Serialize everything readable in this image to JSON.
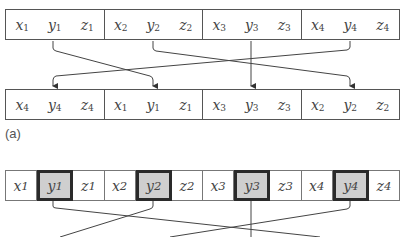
{
  "panel_a": {
    "label": "(a)",
    "top_row": [
      [
        {
          "v": "x",
          "s": "1"
        },
        {
          "v": "y",
          "s": "1"
        },
        {
          "v": "z",
          "s": "1"
        }
      ],
      [
        {
          "v": "x",
          "s": "2"
        },
        {
          "v": "y",
          "s": "2"
        },
        {
          "v": "z",
          "s": "2"
        }
      ],
      [
        {
          "v": "x",
          "s": "3"
        },
        {
          "v": "y",
          "s": "3"
        },
        {
          "v": "z",
          "s": "3"
        }
      ],
      [
        {
          "v": "x",
          "s": "4"
        },
        {
          "v": "y",
          "s": "4"
        },
        {
          "v": "z",
          "s": "4"
        }
      ]
    ],
    "bottom_row": [
      [
        {
          "v": "x",
          "s": "4"
        },
        {
          "v": "y",
          "s": "4"
        },
        {
          "v": "z",
          "s": "4"
        }
      ],
      [
        {
          "v": "x",
          "s": "1"
        },
        {
          "v": "y",
          "s": "1"
        },
        {
          "v": "z",
          "s": "1"
        }
      ],
      [
        {
          "v": "x",
          "s": "3"
        },
        {
          "v": "y",
          "s": "3"
        },
        {
          "v": "z",
          "s": "3"
        }
      ],
      [
        {
          "v": "x",
          "s": "2"
        },
        {
          "v": "y",
          "s": "2"
        },
        {
          "v": "z",
          "s": "2"
        }
      ]
    ],
    "mapping": [
      {
        "from": "group 1 (y1)",
        "to": "position 2"
      },
      {
        "from": "group 2 (y2)",
        "to": "position 4"
      },
      {
        "from": "group 3 (y3)",
        "to": "position 3"
      },
      {
        "from": "group 4 (y4)",
        "to": "position 1"
      }
    ]
  },
  "panel_b": {
    "cells": [
      {
        "v": "x",
        "s": "1",
        "highlight": false
      },
      {
        "v": "y",
        "s": "1",
        "highlight": true
      },
      {
        "v": "z",
        "s": "1",
        "highlight": false
      },
      {
        "v": "x",
        "s": "2",
        "highlight": false
      },
      {
        "v": "y",
        "s": "2",
        "highlight": true
      },
      {
        "v": "z",
        "s": "2",
        "highlight": false
      },
      {
        "v": "x",
        "s": "3",
        "highlight": false
      },
      {
        "v": "y",
        "s": "3",
        "highlight": true
      },
      {
        "v": "z",
        "s": "3",
        "highlight": false
      },
      {
        "v": "x",
        "s": "4",
        "highlight": false
      },
      {
        "v": "y",
        "s": "4",
        "highlight": true
      },
      {
        "v": "z",
        "s": "4",
        "highlight": false
      }
    ]
  },
  "colors": {
    "line": "#444444",
    "highlight_fill": "#cfcfcf",
    "highlight_border": "#2a2a2a"
  }
}
